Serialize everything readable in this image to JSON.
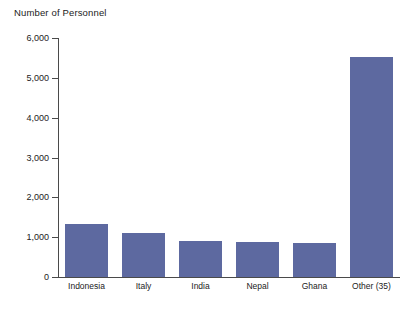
{
  "chart_data": {
    "type": "bar",
    "title": "Number of Personnel",
    "xlabel": "",
    "ylabel": "Number of Personnel",
    "categories": [
      "Indonesia",
      "Italy",
      "India",
      "Nepal",
      "Ghana",
      "Other (35)"
    ],
    "values": [
      1330,
      1100,
      900,
      890,
      850,
      5520
    ],
    "ylim": [
      0,
      6000
    ],
    "ytick_values": [
      0,
      1000,
      2000,
      3000,
      4000,
      5000,
      6000
    ],
    "ytick_labels": [
      "0",
      "1,000",
      "2,000",
      "3,000",
      "4,000",
      "5,000",
      "6,000"
    ],
    "grid": false,
    "legend": false,
    "series": [
      {
        "name": "Number of Personnel",
        "values": [
          1330,
          1100,
          900,
          890,
          850,
          5520
        ]
      }
    ],
    "colors": {
      "bar": "#5d69a0",
      "axis": "#4a4a4a",
      "text": "#222222",
      "background": "#ffffff"
    }
  }
}
